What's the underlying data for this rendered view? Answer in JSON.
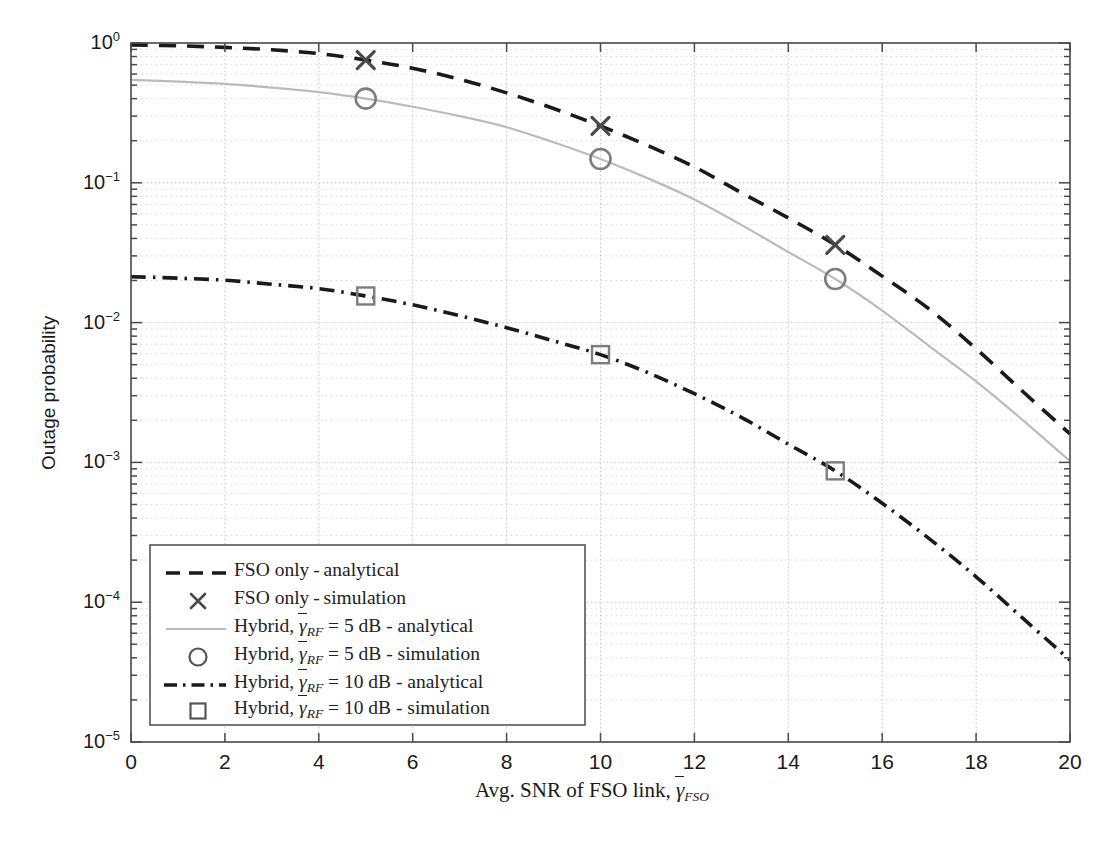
{
  "chart_data": {
    "type": "line",
    "title": "",
    "xlabel": "Avg. SNR of FSO link, γ̄_FSO",
    "ylabel": "Outage probability",
    "xlim": [
      0,
      20
    ],
    "ylim": [
      1e-05,
      1
    ],
    "yscale": "log",
    "grid": true,
    "grid_minor": true,
    "legend_position": "lower left",
    "xticks": [
      "0",
      "2",
      "4",
      "6",
      "8",
      "10",
      "12",
      "14",
      "16",
      "18",
      "20"
    ],
    "yticks": [
      "10^0",
      "10^-1",
      "10^-2",
      "10^-3",
      "10^-4",
      "10^-5"
    ],
    "series": [
      {
        "name": "FSO only - analytical",
        "style": "dashed",
        "color": "#1a1a1a",
        "marker": "none",
        "x": [
          0,
          1,
          2,
          3,
          4,
          5,
          6,
          7,
          8,
          9,
          10,
          11,
          12,
          13,
          14,
          15,
          16,
          17,
          18,
          19,
          20
        ],
        "y": [
          0.97,
          0.955,
          0.93,
          0.895,
          0.84,
          0.755,
          0.66,
          0.55,
          0.44,
          0.34,
          0.255,
          0.185,
          0.13,
          0.085,
          0.056,
          0.036,
          0.0215,
          0.0125,
          0.0065,
          0.0032,
          0.0016
        ]
      },
      {
        "name": "FSO only - simulation",
        "style": "markers",
        "color": "#4a4a4a",
        "marker": "x",
        "x": [
          5,
          10,
          15
        ],
        "y": [
          0.755,
          0.255,
          0.036
        ]
      },
      {
        "name": "Hybrid, gamma_RF = 5 dB - analytical",
        "style": "solid",
        "color": "#bbbbbb",
        "marker": "none",
        "x": [
          0,
          1,
          2,
          3,
          4,
          5,
          6,
          7,
          8,
          9,
          10,
          11,
          12,
          13,
          14,
          15,
          16,
          17,
          18,
          19,
          20
        ],
        "y": [
          0.545,
          0.53,
          0.51,
          0.48,
          0.445,
          0.4,
          0.35,
          0.3,
          0.25,
          0.195,
          0.148,
          0.108,
          0.076,
          0.05,
          0.032,
          0.0205,
          0.0122,
          0.0068,
          0.0038,
          0.002,
          0.00102
        ]
      },
      {
        "name": "Hybrid, gamma_RF = 5 dB - simulation",
        "style": "markers",
        "color": "#7d7d7d",
        "marker": "o",
        "x": [
          5,
          10,
          15
        ],
        "y": [
          0.4,
          0.148,
          0.0205
        ]
      },
      {
        "name": "Hybrid, gamma_RF = 10 dB - analytical",
        "style": "dashdot",
        "color": "#1a1a1a",
        "marker": "none",
        "x": [
          0,
          1,
          2,
          3,
          4,
          5,
          6,
          7,
          8,
          9,
          10,
          11,
          12,
          13,
          14,
          15,
          16,
          17,
          18,
          19,
          20
        ],
        "y": [
          0.0213,
          0.0208,
          0.0201,
          0.0188,
          0.0175,
          0.0155,
          0.0134,
          0.0112,
          0.0092,
          0.0074,
          0.0059,
          0.0044,
          0.0031,
          0.0021,
          0.00135,
          0.00087,
          0.00051,
          0.000285,
          0.000152,
          7.65e-05,
          3.85e-05
        ]
      },
      {
        "name": "Hybrid, gamma_RF = 10 dB - simulation",
        "style": "markers",
        "color": "#7d7d7d",
        "marker": "s",
        "x": [
          5,
          10,
          15
        ],
        "y": [
          0.0155,
          0.0059,
          0.00087
        ]
      }
    ]
  },
  "axes": {
    "ylabel": "Outage probability",
    "xlabel_prefix": "Avg. SNR of FSO link,",
    "xlabel_gamma": "γ",
    "xlabel_sub": "FSO",
    "xticks": [
      "0",
      "2",
      "4",
      "6",
      "8",
      "10",
      "12",
      "14",
      "16",
      "18",
      "20"
    ],
    "yticks": [
      {
        "mantissa": "10",
        "exp": "0"
      },
      {
        "mantissa": "10",
        "exp": "−1"
      },
      {
        "mantissa": "10",
        "exp": "−2"
      },
      {
        "mantissa": "10",
        "exp": "−3"
      },
      {
        "mantissa": "10",
        "exp": "−4"
      },
      {
        "mantissa": "10",
        "exp": "−5"
      }
    ]
  },
  "legend": {
    "items": [
      {
        "sample": "dashed-line",
        "pre": "FSO only - analytical",
        "gamma": "",
        "sub": "",
        "post": ""
      },
      {
        "sample": "x-marker",
        "pre": "FSO only - simulation",
        "gamma": "",
        "sub": "",
        "post": ""
      },
      {
        "sample": "solid-gray-line",
        "pre": "Hybrid,",
        "gamma": "γ",
        "sub": "RF",
        "post": "= 5 dB - analytical"
      },
      {
        "sample": "circle-marker",
        "pre": "Hybrid,",
        "gamma": "γ",
        "sub": "RF",
        "post": "= 5 dB - simulation"
      },
      {
        "sample": "dashdot-line",
        "pre": "Hybrid,",
        "gamma": "γ",
        "sub": "RF",
        "post": "= 10 dB - analytical"
      },
      {
        "sample": "square-marker",
        "pre": "Hybrid,",
        "gamma": "γ",
        "sub": "RF",
        "post": "= 10 dB - simulation"
      }
    ]
  },
  "colors": {
    "axis": "#4a4a4a",
    "grid_major": "#c9c9c9",
    "grid_minor": "#d8d8d8",
    "fso": "#1a1a1a",
    "hybrid5": "#bbbbbb",
    "hybrid10": "#1a1a1a",
    "marker": "#7d7d7d",
    "background": "#ffffff"
  }
}
